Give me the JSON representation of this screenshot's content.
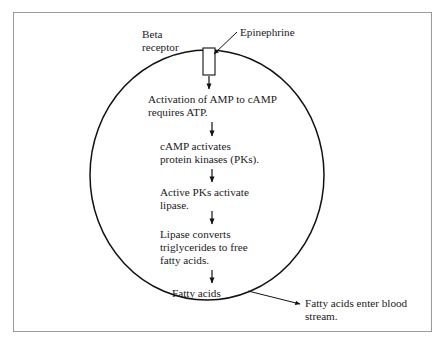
{
  "figure": {
    "type": "flow-diagram",
    "cell_membrane": {
      "shape": "circle",
      "stroke_color": "#111111"
    },
    "frame": {
      "border_color": "#9a9a9a",
      "background": "#ffffff"
    }
  },
  "labels": {
    "beta_receptor": "Beta\nreceptor",
    "epinephrine": "Epinephrine",
    "bloodstream": "Fatty acids enter blood\nstream."
  },
  "steps": [
    {
      "id": "step-1",
      "text": "Activation of AMP to cAMP\nrequires ATP."
    },
    {
      "id": "step-2",
      "text": "cAMP activates\nprotein kinases (PKs)."
    },
    {
      "id": "step-3",
      "text": "Active PKs activate\nlipase."
    },
    {
      "id": "step-4",
      "text": "Lipase converts\ntriglycerides to free\nfatty acids."
    },
    {
      "id": "step-5",
      "text": "Fatty acids"
    }
  ]
}
